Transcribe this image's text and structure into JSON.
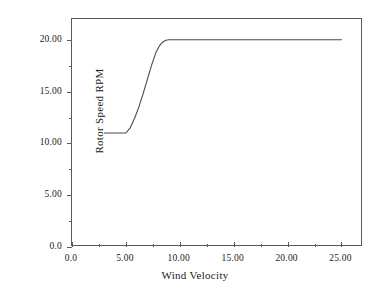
{
  "chart_data": {
    "type": "line",
    "title": "",
    "xlabel": "Wind Velocity",
    "ylabel": "Rotor Speed RPM",
    "xlim": [
      0.0,
      27.0
    ],
    "ylim": [
      0.0,
      22.0
    ],
    "grid": false,
    "legend": null,
    "xticks": [
      {
        "value": 0.0,
        "label": "0.0"
      },
      {
        "value": 5.0,
        "label": "5.00"
      },
      {
        "value": 10.0,
        "label": "10.00"
      },
      {
        "value": 15.0,
        "label": "15.00"
      },
      {
        "value": 20.0,
        "label": "20.00"
      },
      {
        "value": 25.0,
        "label": "25.00"
      }
    ],
    "xminor_ticks": [
      2.5,
      7.5,
      12.5,
      17.5,
      22.5
    ],
    "yticks": [
      {
        "value": 0.0,
        "label": "0.0"
      },
      {
        "value": 5.0,
        "label": "5.00"
      },
      {
        "value": 10.0,
        "label": "10.00"
      },
      {
        "value": 15.0,
        "label": "15.00"
      },
      {
        "value": 20.0,
        "label": "20.00"
      }
    ],
    "yminor_ticks": [
      2.5,
      7.5,
      12.5,
      17.5
    ],
    "line_color": "#4a4a4a",
    "line_width": 1.1,
    "series": [
      {
        "name": "Rotor Speed",
        "x": [
          3.0,
          4.0,
          5.0,
          5.4,
          5.8,
          6.2,
          6.6,
          7.0,
          7.4,
          7.8,
          8.1,
          8.4,
          8.7,
          9.0,
          10.0,
          12.0,
          14.0,
          16.0,
          18.0,
          20.0,
          22.0,
          24.0,
          25.0
        ],
        "y": [
          11.0,
          11.0,
          11.0,
          11.5,
          12.4,
          13.5,
          14.8,
          16.2,
          17.6,
          18.8,
          19.4,
          19.75,
          19.95,
          20.0,
          20.0,
          20.0,
          20.0,
          20.0,
          20.0,
          20.0,
          20.0,
          20.0,
          20.0
        ]
      }
    ]
  }
}
